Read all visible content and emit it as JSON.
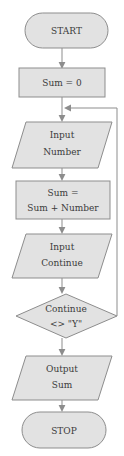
{
  "diagram": {
    "background_color": "#ffffff",
    "shape_fill_color": "#e2e2e2",
    "shape_border_color": "#8d8d8d",
    "connector_color": "#8d8d8d",
    "text_color": "#3b3b3b"
  },
  "nodes": {
    "start": {
      "type": "terminator",
      "label": "START"
    },
    "init_sum": {
      "type": "process",
      "label": "Sum = 0"
    },
    "input_number": {
      "type": "input-output",
      "line1": "Input",
      "line2": "Number"
    },
    "accumulate": {
      "type": "process",
      "line1": "Sum =",
      "line2": "Sum + Number"
    },
    "input_continue": {
      "type": "input-output",
      "line1": "Input",
      "line2": "Continue"
    },
    "decision": {
      "type": "decision",
      "line1": "Continue",
      "line2": "<> \"Y\""
    },
    "output_sum": {
      "type": "input-output",
      "line1": "Output",
      "line2": "Sum"
    },
    "stop": {
      "type": "terminator",
      "label": "STOP"
    }
  },
  "edges": [
    {
      "from": "start",
      "to": "init_sum",
      "label": ""
    },
    {
      "from": "init_sum",
      "to": "input_number",
      "label": ""
    },
    {
      "from": "input_number",
      "to": "accumulate",
      "label": ""
    },
    {
      "from": "accumulate",
      "to": "input_continue",
      "label": ""
    },
    {
      "from": "input_continue",
      "to": "decision",
      "label": ""
    },
    {
      "from": "decision",
      "to": "input_number",
      "label": ""
    },
    {
      "from": "decision",
      "to": "output_sum",
      "label": ""
    },
    {
      "from": "output_sum",
      "to": "stop",
      "label": ""
    }
  ]
}
